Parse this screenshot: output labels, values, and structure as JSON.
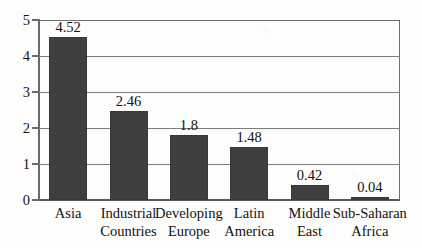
{
  "chart_data": {
    "type": "bar",
    "title": "",
    "subtitle": "",
    "xlabel": "",
    "ylabel": "",
    "categories": [
      "Asia",
      "Industrial Countries",
      "Developing Europe",
      "Latin America",
      "Middle East",
      "Sub-Saharan Africa"
    ],
    "category_lines": [
      [
        "Asia"
      ],
      [
        "Industrial",
        "Countries"
      ],
      [
        "Developing",
        "Europe"
      ],
      [
        "Latin",
        "America"
      ],
      [
        "Middle",
        "East"
      ],
      [
        "Sub-Saharan",
        "Africa"
      ]
    ],
    "values": [
      4.52,
      2.46,
      1.8,
      1.48,
      0.42,
      0.04
    ],
    "value_labels": [
      "4.52",
      "2.46",
      "1.8",
      "1.48",
      "0.42",
      "0.04"
    ],
    "ylim": [
      0,
      5
    ],
    "yticks": [
      0,
      1,
      2,
      3,
      4,
      5
    ],
    "ytick_labels": [
      "0",
      "1",
      "2",
      "3",
      "4",
      "5"
    ],
    "grid": true,
    "grid_axis": "y",
    "legend": false,
    "legend_position": "none",
    "bar_color": "#403F3F",
    "grid_color": "#7C7C7C",
    "axis_color": "#6A6A6A",
    "background_color": "#FDFDFC",
    "text_color": "#121212"
  }
}
